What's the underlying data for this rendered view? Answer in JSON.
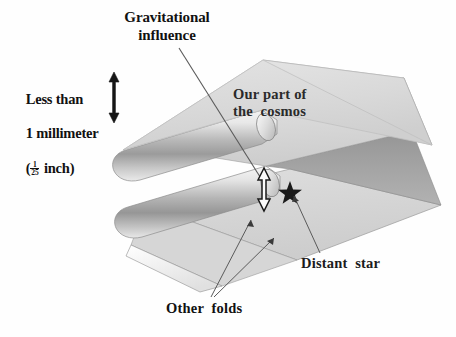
{
  "figure": {
    "background_color": "#fefefe"
  },
  "labels": {
    "gravitational_influence": "Gravitational\ninfluence",
    "thickness_line1": "Less than",
    "thickness_line2": "1 millimeter",
    "thickness_paren_open": "(",
    "thickness_fraction_numerator": "1",
    "thickness_fraction_denominator": "25",
    "thickness_unit": " inch)",
    "our_part_of_cosmos": "Our part of\nthe  cosmos",
    "distant_star": "Distant  star",
    "other_folds": "Other  folds"
  },
  "icons": {
    "star": "star-icon",
    "gravity_arrow": "double-headed-arrow-icon",
    "thickness_arrow": "double-headed-arrow-icon"
  },
  "colors": {
    "sheet_top_light": "#dcdcdc",
    "sheet_top_light_edge": "#cfcfcf",
    "sheet_band_dark": "#9a9a9a",
    "sheet_band_mid": "#b0b0b0",
    "fold_highlight": "#f2f2f2",
    "fold_shadow": "#8e8e8e",
    "fold_tip_white": "#fbfbfb",
    "outline": "#6e6e6e",
    "leader_line": "#555555",
    "text": "#111111",
    "background": "#fefefe"
  },
  "diagram_elements": {
    "sheet_count": 3,
    "fold_count": 2,
    "description": "A continuous sheet folded back on itself forming three stacked layers connected by two rounded folds at the left edge",
    "annotated_points": [
      {
        "name": "gravitational-influence",
        "target": "gap between top sheet and second layer"
      },
      {
        "name": "thickness",
        "target": "vertical separation between layers"
      },
      {
        "name": "our-part-of-cosmos",
        "target": "uppermost sheet surface"
      },
      {
        "name": "distant-star",
        "target": "star marker on second layer surface"
      },
      {
        "name": "other-folds",
        "target": "lower fold surfaces"
      }
    ]
  }
}
